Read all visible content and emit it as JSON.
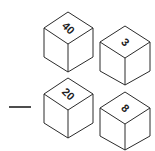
{
  "diagram": {
    "operator": "-",
    "cubes": [
      {
        "label": "40",
        "position": "top-left"
      },
      {
        "label": "3",
        "position": "top-right"
      },
      {
        "label": "20",
        "position": "bottom-left"
      },
      {
        "label": "8",
        "position": "bottom-right"
      }
    ],
    "colors": {
      "stroke": "#2b2b2b",
      "fill": "#ffffff",
      "background": "#ffffff"
    }
  }
}
